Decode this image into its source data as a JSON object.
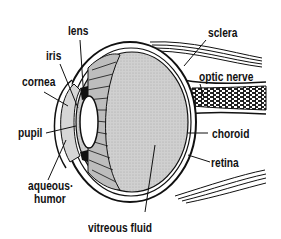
{
  "diagram": {
    "labels": {
      "lens": "lens",
      "iris": "iris",
      "cornea": "cornea",
      "pupil": "pupil",
      "aqueous_humor_line1": "aqueous·",
      "aqueous_humor_line2": "humor",
      "sclera": "sclera",
      "optic_nerve": "optic nerve",
      "choroid": "choroid",
      "retina": "retina",
      "vitreous_fluid": "vitreous fluid"
    },
    "colors": {
      "ink": "#111111",
      "fill_gray": "#c8c8c8",
      "background": "#ffffff"
    }
  }
}
